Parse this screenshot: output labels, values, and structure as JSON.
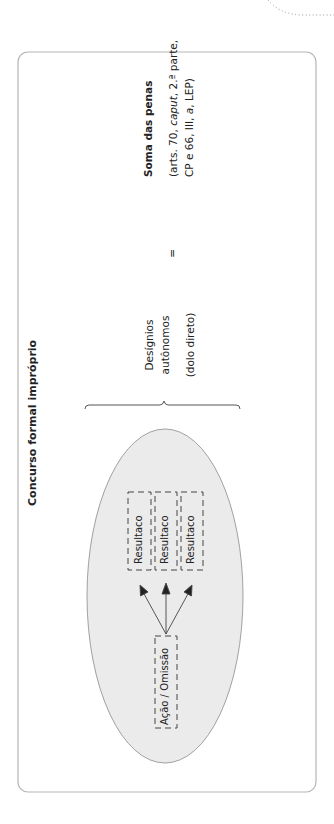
{
  "title": "Concurso formal impróprio",
  "source_node": {
    "label": "Ação / Omissão"
  },
  "result_nodes": [
    {
      "label": "Resultaco"
    },
    {
      "label": "Resultaco"
    },
    {
      "label": "Resultaco"
    }
  ],
  "condition": {
    "line1": "Desígnios",
    "line2": "autônomos",
    "line3": "(dolo direto)"
  },
  "equals_sign": "=",
  "consequence": {
    "heading": "Soma das penas",
    "ref_line1_a": "(arts. 70, ",
    "ref_line1_italic": "caput",
    "ref_line1_b": ", 2.ª parte,",
    "ref_line2_a": "CP e 66, III, ",
    "ref_line2_italic": "a",
    "ref_line2_b": ", LEP)"
  },
  "colors": {
    "ellipse_fill": "#ebebeb",
    "ellipse_stroke": "#8a8a8a",
    "border": "#b5b5b5",
    "text": "#222222"
  }
}
